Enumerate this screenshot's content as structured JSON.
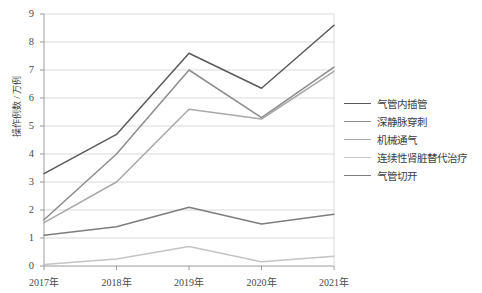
{
  "chart_data": {
    "type": "line",
    "title": "",
    "xlabel": "",
    "ylabel": "操作例数 / 万例",
    "categories": [
      "2017年",
      "2018年",
      "2019年",
      "2020年",
      "2021年"
    ],
    "ylim": [
      0,
      9
    ],
    "ytick_step": 1,
    "yticks": [
      "0",
      "1",
      "2",
      "3",
      "4",
      "5",
      "6",
      "7",
      "8",
      "9"
    ],
    "grid": "horizontal",
    "legend_position": "right",
    "series": [
      {
        "name": "气管内插管",
        "color": "#5a5a5a",
        "values": [
          3.3,
          4.7,
          7.6,
          6.35,
          8.6
        ]
      },
      {
        "name": "深静脉穿刺",
        "color": "#8c8c8c",
        "values": [
          1.65,
          4.0,
          7.0,
          5.3,
          7.1
        ]
      },
      {
        "name": "机械通气",
        "color": "#a8a8a8",
        "values": [
          1.55,
          3.0,
          5.6,
          5.25,
          6.95
        ]
      },
      {
        "name": "连续性肾脏替代治疗",
        "color": "#c4c4c4",
        "values": [
          0.05,
          0.25,
          0.7,
          0.15,
          0.35
        ]
      },
      {
        "name": "气管切开",
        "color": "#7d7d7d",
        "values": [
          1.1,
          1.4,
          2.1,
          1.5,
          1.85
        ]
      }
    ]
  },
  "axis": {
    "y_title": "操作例数 / 万例"
  },
  "legend": {
    "items": [
      {
        "label": "气管内插管"
      },
      {
        "label": "深静脉穿刺"
      },
      {
        "label": "机械通气"
      },
      {
        "label": "连续性肾脏替代治疗"
      },
      {
        "label": "气管切开"
      }
    ]
  }
}
